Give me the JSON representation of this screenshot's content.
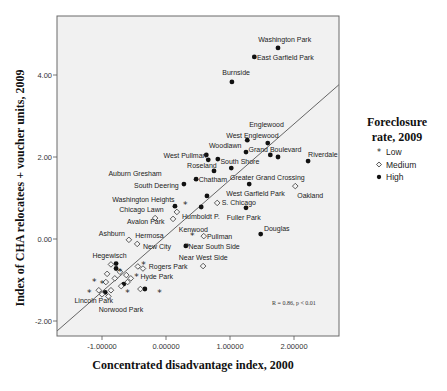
{
  "chart_data": {
    "type": "scatter",
    "title": "",
    "xlabel": "Concentrated disadvantage index, 2000",
    "ylabel": "Index of CHA relocatees + voucher units, 2009",
    "xlim": [
      -1.7,
      2.7
    ],
    "ylim": [
      -2.35,
      5.45
    ],
    "xticks": [
      -1,
      0,
      1,
      2
    ],
    "xtick_labels": [
      "-1.00000",
      "0.00000",
      "1.00000",
      "2.00000"
    ],
    "yticks": [
      -2,
      0,
      2,
      4
    ],
    "ytick_labels": [
      "-2.00",
      "0.00",
      "2.00",
      "4.00"
    ],
    "grid": false,
    "legend": {
      "title": "Foreclosure rate, 2009",
      "title_lines": [
        "Foreclosure",
        "rate, 2009"
      ],
      "position": "right",
      "entries": [
        {
          "name": "Low",
          "marker": "star"
        },
        {
          "name": "Medium",
          "marker": "diamond"
        },
        {
          "name": "High",
          "marker": "circle"
        }
      ]
    },
    "fit_line": {
      "x": [
        -1.7,
        2.7
      ],
      "y": [
        -2.24,
        3.76
      ]
    },
    "annotation": "R = 0.86, p < 0.01",
    "series": [
      {
        "name": "High",
        "marker": "circle",
        "points": [
          {
            "x": 1.75,
            "y": 4.66,
            "label": "Washington Park"
          },
          {
            "x": 1.38,
            "y": 4.44,
            "label": "East Garfield Park"
          },
          {
            "x": 1.03,
            "y": 3.83,
            "label": "Burnside"
          },
          {
            "x": 1.27,
            "y": 2.41,
            "label": "Englewood"
          },
          {
            "x": 1.59,
            "y": 2.34,
            "label": "West Englewood"
          },
          {
            "x": 1.25,
            "y": 2.12,
            "label": "Woodlawn"
          },
          {
            "x": 1.63,
            "y": 2.05,
            "label": "Grand Boulevard"
          },
          {
            "x": 1.75,
            "y": 2.0,
            "label": ""
          },
          {
            "x": 2.22,
            "y": 1.9,
            "label": "Riverdale"
          },
          {
            "x": 0.63,
            "y": 2.05,
            "label": "West Pullman"
          },
          {
            "x": 0.66,
            "y": 1.93,
            "label": ""
          },
          {
            "x": 0.81,
            "y": 1.95,
            "label": "South Shore"
          },
          {
            "x": 1.02,
            "y": 1.73,
            "label": ""
          },
          {
            "x": 0.75,
            "y": 1.66,
            "label": "Roseland"
          },
          {
            "x": 0.47,
            "y": 1.46,
            "label": "Chatham"
          },
          {
            "x": 0.28,
            "y": 1.34,
            "label": "South Deering"
          },
          {
            "x": 1.3,
            "y": 1.34,
            "label": "Greater Grand Crossing"
          },
          {
            "x": 0.64,
            "y": 1.05,
            "label": ""
          },
          {
            "x": 0.14,
            "y": 0.8,
            "label": "Washington Heights"
          },
          {
            "x": 0.55,
            "y": 0.78,
            "label": ""
          },
          {
            "x": 1.25,
            "y": 0.76,
            "label": "Fuller Park"
          },
          {
            "x": 1.48,
            "y": 0.12,
            "label": "Douglas"
          },
          {
            "x": 0.31,
            "y": -0.17,
            "label": "New City"
          },
          {
            "x": -0.78,
            "y": -0.6,
            "label": "Hegewisch"
          },
          {
            "x": -0.78,
            "y": -0.72,
            "label": ""
          },
          {
            "x": -0.66,
            "y": -1.1,
            "label": ""
          },
          {
            "x": -0.33,
            "y": -1.22,
            "label": ""
          },
          {
            "x": -0.95,
            "y": -1.3,
            "label": ""
          }
        ]
      },
      {
        "name": "Medium",
        "marker": "diamond",
        "points": [
          {
            "x": 2.02,
            "y": 1.29,
            "label": "Oakland"
          },
          {
            "x": 0.8,
            "y": 0.88,
            "label": "S. Chicago"
          },
          {
            "x": 0.17,
            "y": 0.66,
            "label": "Chicago Lawn"
          },
          {
            "x": 0.11,
            "y": 0.49,
            "label": "Humboldt P."
          },
          {
            "x": -0.17,
            "y": 0.51,
            "label": "Avalon Park"
          },
          {
            "x": 0.59,
            "y": 0.07,
            "label": "Pullman"
          },
          {
            "x": -0.58,
            "y": -0.02,
            "label": "Ashburn"
          },
          {
            "x": -0.45,
            "y": -0.12,
            "label": "Hermosa"
          },
          {
            "x": 0.58,
            "y": -0.66,
            "label": "Near West Side"
          },
          {
            "x": -0.86,
            "y": -0.62,
            "label": ""
          },
          {
            "x": -0.44,
            "y": -0.67,
            "label": ""
          },
          {
            "x": -0.36,
            "y": -0.72,
            "label": "Rogers Park"
          },
          {
            "x": -0.92,
            "y": -0.85,
            "label": ""
          },
          {
            "x": -0.72,
            "y": -0.8,
            "label": ""
          },
          {
            "x": -0.62,
            "y": -0.88,
            "label": ""
          },
          {
            "x": -0.8,
            "y": -0.96,
            "label": ""
          },
          {
            "x": -0.55,
            "y": -0.96,
            "label": ""
          },
          {
            "x": -0.94,
            "y": -1.05,
            "label": ""
          },
          {
            "x": -0.6,
            "y": -1.05,
            "label": ""
          },
          {
            "x": -0.7,
            "y": -1.15,
            "label": ""
          },
          {
            "x": -0.4,
            "y": -1.22,
            "label": ""
          },
          {
            "x": -1.05,
            "y": -1.25,
            "label": ""
          },
          {
            "x": -0.86,
            "y": -1.25,
            "label": ""
          },
          {
            "x": -1.0,
            "y": -1.35,
            "label": "Lincoln Park"
          },
          {
            "x": -0.9,
            "y": -1.4,
            "label": "Norwood Park"
          }
        ]
      },
      {
        "name": "Low",
        "marker": "star",
        "points": [
          {
            "x": 0.3,
            "y": 0.83,
            "label": ""
          },
          {
            "x": 0.41,
            "y": 0.07,
            "label": "Kenwood"
          },
          {
            "x": 0.34,
            "y": -0.18,
            "label": "Near South Side"
          },
          {
            "x": -0.35,
            "y": -0.62,
            "label": ""
          },
          {
            "x": -0.46,
            "y": -0.93,
            "label": "Hyde Park"
          },
          {
            "x": -1.12,
            "y": -1.05,
            "label": ""
          },
          {
            "x": -1.2,
            "y": -1.3,
            "label": ""
          },
          {
            "x": -0.6,
            "y": -1.3,
            "label": ""
          },
          {
            "x": -0.1,
            "y": -1.32,
            "label": ""
          },
          {
            "x": -1.0,
            "y": -1.1,
            "label": ""
          },
          {
            "x": -0.72,
            "y": -0.8,
            "label": ""
          }
        ]
      }
    ],
    "label_positions": [
      {
        "text": "Washington Park",
        "x": 1.44,
        "y": 4.8
      },
      {
        "text": "East Garfield Park",
        "x": 1.42,
        "y": 4.36
      },
      {
        "text": "Burnside",
        "x": 0.88,
        "y": 4.0
      },
      {
        "text": "Englewood",
        "x": 1.3,
        "y": 2.73
      },
      {
        "text": "West Englewood",
        "x": 0.94,
        "y": 2.47
      },
      {
        "text": "Woodlawn",
        "x": 0.67,
        "y": 2.23
      },
      {
        "text": "Grand Boulevard",
        "x": 1.29,
        "y": 2.11
      },
      {
        "text": "Riverdale",
        "x": 2.22,
        "y": 2.0
      },
      {
        "text": "West Pullman",
        "x": -0.04,
        "y": 1.97
      },
      {
        "text": "South Shore",
        "x": 0.85,
        "y": 1.84
      },
      {
        "text": "Roseland",
        "x": 0.33,
        "y": 1.72
      },
      {
        "text": "Auburn Gresham",
        "x": -0.9,
        "y": 1.53
      },
      {
        "text": "South Deering",
        "x": -0.5,
        "y": 1.24
      },
      {
        "text": "Chatham",
        "x": 0.51,
        "y": 1.38
      },
      {
        "text": "Greater Grand Crossing",
        "x": 1.0,
        "y": 1.43
      },
      {
        "text": "West Garfield Park",
        "x": 0.94,
        "y": 1.04
      },
      {
        "text": "Oakland",
        "x": 2.05,
        "y": 1.0
      },
      {
        "text": "Washington Heights",
        "x": -0.84,
        "y": 0.91
      },
      {
        "text": "S. Chicago",
        "x": 0.87,
        "y": 0.83
      },
      {
        "text": "Chicago Lawn",
        "x": -0.73,
        "y": 0.66
      },
      {
        "text": "Humboldt P.",
        "x": 0.25,
        "y": 0.48
      },
      {
        "text": "Fuller Park",
        "x": 0.95,
        "y": 0.46
      },
      {
        "text": "Avalon Park",
        "x": -0.61,
        "y": 0.36
      },
      {
        "text": "Kenwood",
        "x": 0.2,
        "y": 0.17
      },
      {
        "text": "Douglas",
        "x": 1.53,
        "y": 0.19
      },
      {
        "text": "Ashburn",
        "x": -1.05,
        "y": 0.08
      },
      {
        "text": "Hermosa",
        "x": -0.48,
        "y": 0.02
      },
      {
        "text": "Pullman",
        "x": 0.64,
        "y": 0.0
      },
      {
        "text": "New City",
        "x": -0.36,
        "y": -0.25
      },
      {
        "text": "Near South Side",
        "x": 0.35,
        "y": -0.25
      },
      {
        "text": "Near West Side",
        "x": 0.2,
        "y": -0.5
      },
      {
        "text": "Hegewisch",
        "x": -1.15,
        "y": -0.47
      },
      {
        "text": "Rogers Park",
        "x": -0.27,
        "y": -0.74
      },
      {
        "text": "Hyde Park",
        "x": -0.4,
        "y": -0.97
      },
      {
        "text": "Lincoln Park",
        "x": -1.43,
        "y": -1.55
      },
      {
        "text": "Norwood Park",
        "x": -1.05,
        "y": -1.77
      }
    ]
  }
}
